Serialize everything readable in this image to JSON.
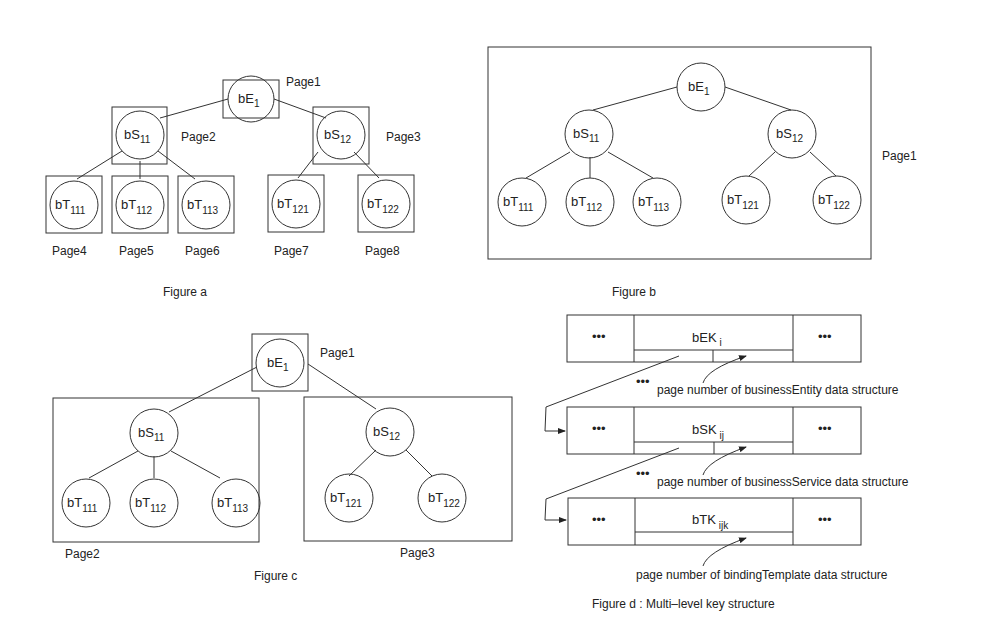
{
  "figure_a": {
    "caption": "Figure a",
    "root": {
      "base": "bE",
      "sub": "1",
      "page": "Page1"
    },
    "services": [
      {
        "base": "bS",
        "sub": "11",
        "page": "Page2"
      },
      {
        "base": "bS",
        "sub": "12",
        "page": "Page3"
      }
    ],
    "templates": [
      {
        "base": "bT",
        "sub": "111",
        "page": "Page4"
      },
      {
        "base": "bT",
        "sub": "112",
        "page": "Page5"
      },
      {
        "base": "bT",
        "sub": "113",
        "page": "Page6"
      },
      {
        "base": "bT",
        "sub": "121",
        "page": "Page7"
      },
      {
        "base": "bT",
        "sub": "122",
        "page": "Page8"
      }
    ]
  },
  "figure_b": {
    "caption": "Figure b",
    "page": "Page1",
    "root": {
      "base": "bE",
      "sub": "1"
    },
    "services": [
      {
        "base": "bS",
        "sub": "11"
      },
      {
        "base": "bS",
        "sub": "12"
      }
    ],
    "templates": [
      {
        "base": "bT",
        "sub": "111"
      },
      {
        "base": "bT",
        "sub": "112"
      },
      {
        "base": "bT",
        "sub": "113"
      },
      {
        "base": "bT",
        "sub": "121"
      },
      {
        "base": "bT",
        "sub": "122"
      }
    ]
  },
  "figure_c": {
    "caption": "Figure c",
    "root": {
      "base": "bE",
      "sub": "1",
      "page": "Page1"
    },
    "groups": [
      {
        "page": "Page2",
        "service": {
          "base": "bS",
          "sub": "11"
        },
        "templates": [
          {
            "base": "bT",
            "sub": "111"
          },
          {
            "base": "bT",
            "sub": "112"
          },
          {
            "base": "bT",
            "sub": "113"
          }
        ]
      },
      {
        "page": "Page3",
        "service": {
          "base": "bS",
          "sub": "12"
        },
        "templates": [
          {
            "base": "bT",
            "sub": "121"
          },
          {
            "base": "bT",
            "sub": "122"
          }
        ]
      }
    ]
  },
  "figure_d": {
    "caption": "Figure d : Multi–level key structure",
    "ellipsis": "•••",
    "rows": [
      {
        "base": "bEK",
        "sub": "i",
        "annotation": "page number of businessEntity data structure"
      },
      {
        "base": "bSK",
        "sub": "ij",
        "annotation": "page number of businessService data structure"
      },
      {
        "base": "bTK",
        "sub": "ijk",
        "annotation": "page number of bindingTemplate data structure"
      }
    ]
  }
}
